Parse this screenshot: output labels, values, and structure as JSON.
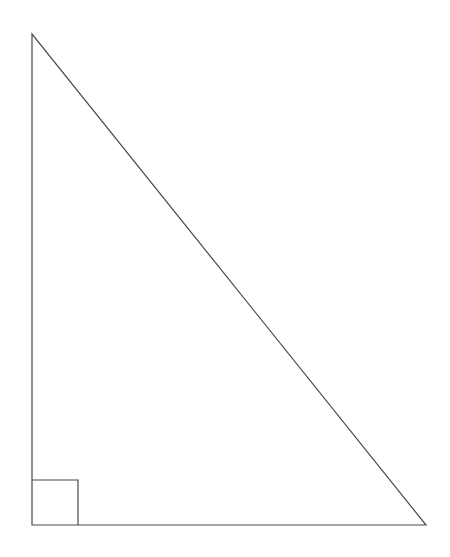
{
  "page": {
    "background_color": "#ffffff",
    "width": 450,
    "height": 557,
    "caption": ""
  },
  "figure": {
    "name": "right-triangle",
    "stroke_color": "#4a4a4a",
    "fill_color": "#ffffff",
    "stroke_width": 1.2,
    "vertices": {
      "apex_label": "",
      "bottom_left_label": "",
      "bottom_right_label": ""
    },
    "right_angle_marker": {
      "present": true,
      "at_vertex": "bottom-left",
      "size": 46
    }
  },
  "chart_data": {
    "type": "scatter",
    "subtitle": "",
    "xlabel": "",
    "ylabel": "",
    "xlim": [
      0,
      450
    ],
    "ylim": [
      0,
      557
    ],
    "grid": false,
    "legend": "none",
    "annotations": [],
    "tick_labels": {
      "x": [],
      "y": []
    },
    "series": [
      {
        "name": "triangle-outline",
        "kind": "closed-polygon",
        "points": [
          {
            "x": 32,
            "y": 34
          },
          {
            "x": 32,
            "y": 525
          },
          {
            "x": 426,
            "y": 525
          }
        ]
      },
      {
        "name": "right-angle-marker",
        "kind": "open-polyline",
        "points": [
          {
            "x": 32,
            "y": 480
          },
          {
            "x": 78,
            "y": 480
          },
          {
            "x": 78,
            "y": 525
          }
        ]
      }
    ],
    "edges": [
      {
        "name": "vertical-leg",
        "from": "apex",
        "to": "bottom-left",
        "length_px": 491
      },
      {
        "name": "horizontal-leg",
        "from": "bottom-left",
        "to": "bottom-right",
        "length_px": 394
      },
      {
        "name": "hypotenuse",
        "from": "apex",
        "to": "bottom-right",
        "length_px": 629
      }
    ]
  }
}
